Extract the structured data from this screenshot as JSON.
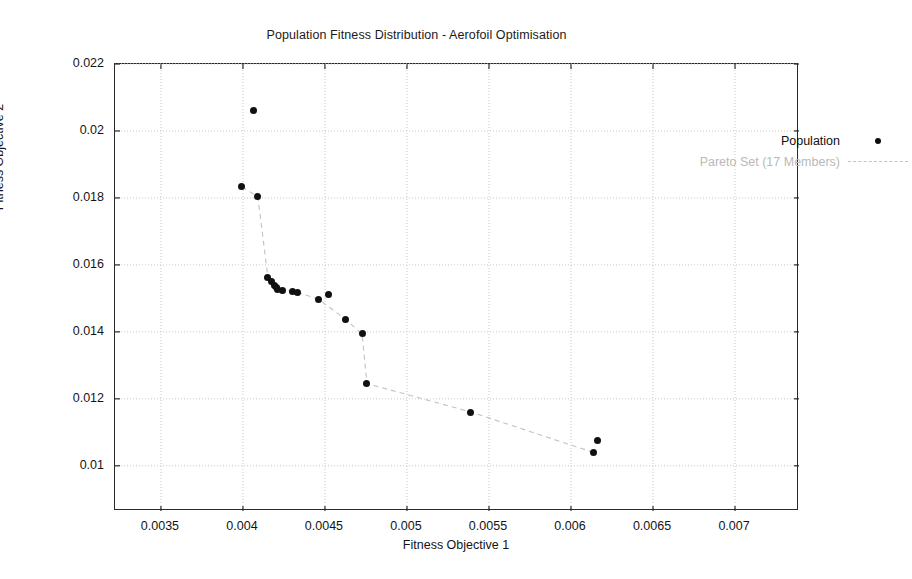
{
  "chart_data": {
    "type": "scatter",
    "title": "Population Fitness Distribution - Aerofoil Optimisation",
    "xlabel": "Fitness Objective 1",
    "ylabel": "Fitness Objective 2",
    "xlim": [
      0.00322,
      0.00739
    ],
    "ylim": [
      0.00865,
      0.022
    ],
    "xticks": [
      0.0035,
      0.004,
      0.0045,
      0.005,
      0.0055,
      0.006,
      0.0065,
      0.007
    ],
    "xtick_labels": [
      "0.0035",
      "0.004",
      "0.0045",
      "0.005",
      "0.0055",
      "0.006",
      "0.0065",
      "0.007"
    ],
    "yticks": [
      0.01,
      0.012,
      0.014,
      0.016,
      0.018,
      0.02,
      0.022
    ],
    "ytick_labels": [
      "0.01",
      "0.012",
      "0.014",
      "0.016",
      "0.018",
      "0.02",
      "0.022"
    ],
    "grid": true,
    "grid_style": "dotted",
    "grid_color": "#c9c9c9",
    "legend_position": "upper right",
    "marker_color": "#111111",
    "pareto_line_color": "#c2c2c2",
    "series": [
      {
        "name": "Population",
        "marker": "dot",
        "points": [
          [
            0.004067,
            0.020606
          ],
          [
            0.003994,
            0.018333
          ],
          [
            0.004091,
            0.01803
          ],
          [
            0.004152,
            0.015636
          ],
          [
            0.004176,
            0.015515
          ],
          [
            0.004195,
            0.015394
          ],
          [
            0.004207,
            0.015333
          ],
          [
            0.004213,
            0.015273
          ],
          [
            0.004244,
            0.015242
          ],
          [
            0.004305,
            0.015212
          ],
          [
            0.004335,
            0.015182
          ],
          [
            0.004463,
            0.01497
          ],
          [
            0.004524,
            0.015121
          ],
          [
            0.004628,
            0.014364
          ],
          [
            0.004726,
            0.013939
          ],
          [
            0.004756,
            0.012455
          ],
          [
            0.00539,
            0.011606
          ],
          [
            0.006159,
            0.010758
          ],
          [
            0.00614,
            0.010394
          ]
        ]
      },
      {
        "name": "Pareto Set (17 Members)",
        "marker": "dashed-line",
        "points": [
          [
            0.003994,
            0.018333
          ],
          [
            0.004091,
            0.01803
          ],
          [
            0.004152,
            0.015636
          ],
          [
            0.004176,
            0.015515
          ],
          [
            0.004195,
            0.015394
          ],
          [
            0.004207,
            0.015333
          ],
          [
            0.004213,
            0.015273
          ],
          [
            0.004244,
            0.015242
          ],
          [
            0.004305,
            0.015212
          ],
          [
            0.004335,
            0.015182
          ],
          [
            0.004463,
            0.01497
          ],
          [
            0.004628,
            0.014364
          ],
          [
            0.004726,
            0.013939
          ],
          [
            0.004756,
            0.012455
          ],
          [
            0.00539,
            0.011606
          ],
          [
            0.00614,
            0.010394
          ]
        ]
      }
    ],
    "legend_entries": [
      {
        "label": "Population",
        "key": "dot"
      },
      {
        "label": "Pareto Set (17 Members)",
        "key": "dashed-line"
      }
    ]
  }
}
